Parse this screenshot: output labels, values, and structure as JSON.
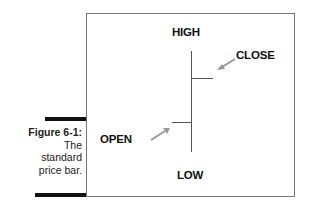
{
  "caption": {
    "figure": "Figure 6-1:",
    "line1": "The",
    "line2": "standard",
    "line3": "price bar."
  },
  "diagram": {
    "labels": {
      "high": "HIGH",
      "close": "CLOSE",
      "open": "OPEN",
      "low": "LOW"
    },
    "colors": {
      "line": "#555555",
      "arrow": "#999999",
      "frame": "#777777",
      "accent_bar": "#111111"
    }
  }
}
